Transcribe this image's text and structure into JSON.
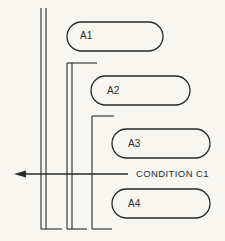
{
  "diagram": {
    "blocks": [
      {
        "id": "a1",
        "label": "A1"
      },
      {
        "id": "a2",
        "label": "A2"
      },
      {
        "id": "a3",
        "label": "A3"
      },
      {
        "id": "a4",
        "label": "A4"
      }
    ],
    "condition": {
      "label": "CONDITION C1",
      "arrow_direction": "left"
    },
    "colors": {
      "background": "#f7f6f1",
      "line": "#2a2a2a"
    }
  }
}
